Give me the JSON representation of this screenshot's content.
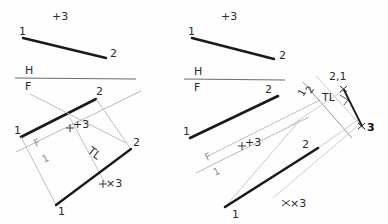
{
  "sheet": {
    "title": "Descriptive geometry construction: true length and point view of line 1-2",
    "background_color": "#fefefe",
    "object_line_color": "#1a1a1a",
    "construction_line_color": "#aaaaaa",
    "text_color": "#2b2b2b"
  },
  "left_problem": {
    "name": "true-length-construction",
    "top_view": {
      "plus_marker": "+3",
      "endpoint_1": "1",
      "endpoint_2": "2"
    },
    "fold_line_hf": {
      "upper_label": "H",
      "lower_label": "F"
    },
    "front_view": {
      "endpoint_1": "1",
      "endpoint_2": "2"
    },
    "fold_line_f1": {
      "upper_label": "F",
      "lower_label": "1"
    },
    "auxiliary_view": {
      "endpoint_1": "1",
      "endpoint_2": "2",
      "true_length_label": "TL",
      "plus_marker_front": "+3",
      "plus_marker_aux": "×3"
    }
  },
  "right_problem": {
    "name": "point-view-construction",
    "top_view": {
      "plus_marker": "+3",
      "endpoint_1": "1",
      "endpoint_2": "2"
    },
    "fold_line_hf": {
      "upper_label": "H",
      "lower_label": "F"
    },
    "front_view": {
      "endpoint_1": "1",
      "endpoint_2": "2"
    },
    "fold_line_f1": {
      "upper_label": "F",
      "lower_label": "1"
    },
    "auxiliary_view": {
      "endpoint_1": "1",
      "endpoint_2": "2",
      "true_length_label": "TL",
      "plus_marker_front": "+3",
      "plus_marker_aux": "×3"
    },
    "fold_line_12": {
      "upper_label": "1",
      "lower_label": "2"
    },
    "point_view": {
      "coincident_label": "2,1",
      "true_length_label": "TL",
      "point_3_label": "3"
    }
  }
}
